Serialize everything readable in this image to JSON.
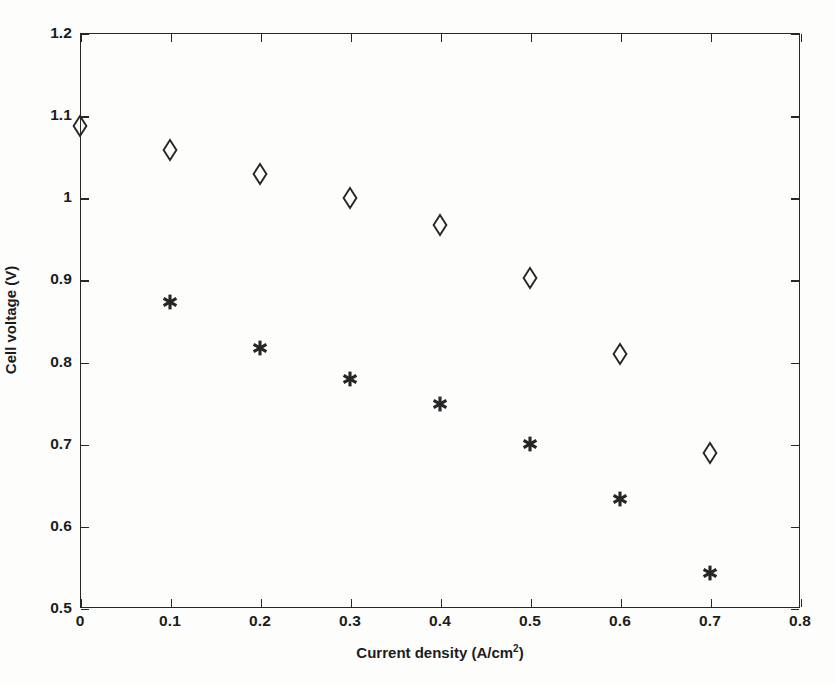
{
  "chart_data": {
    "type": "scatter",
    "title": "",
    "xlabel": "Current density (A/cm",
    "xlabel_sup": "2",
    "xlabel_tail": ")",
    "xlabel_full": "Current density (A/cm2)",
    "ylabel": "Cell voltage (V)",
    "xlim": [
      0,
      0.8
    ],
    "ylim": [
      0.5,
      1.2
    ],
    "xticks": [
      "0",
      "0.1",
      "0.2",
      "0.3",
      "0.4",
      "0.5",
      "0.6",
      "0.7",
      "0.8"
    ],
    "xtick_values": [
      0,
      0.1,
      0.2,
      0.3,
      0.4,
      0.5,
      0.6,
      0.7,
      0.8
    ],
    "yticks": [
      "0.5",
      "0.6",
      "0.7",
      "0.8",
      "0.9",
      "1",
      "1.1",
      "1.2"
    ],
    "ytick_values": [
      0.5,
      0.6,
      0.7,
      0.8,
      0.9,
      1.0,
      1.1,
      1.2
    ],
    "grid": false,
    "legend": "none",
    "frame": "box",
    "tick_direction": "in",
    "marker_color": "#262626",
    "series": [
      {
        "name": "diamond-series",
        "marker": "open-diamond",
        "x": [
          0,
          0.1,
          0.2,
          0.3,
          0.4,
          0.5,
          0.6,
          0.7
        ],
        "y": [
          1.087,
          1.058,
          1.028,
          0.999,
          0.966,
          0.902,
          0.809,
          0.689
        ]
      },
      {
        "name": "asterisk-series",
        "marker": "asterisk",
        "x": [
          0.1,
          0.2,
          0.3,
          0.4,
          0.5,
          0.6,
          0.7
        ],
        "y": [
          0.872,
          0.817,
          0.779,
          0.748,
          0.7,
          0.633,
          0.543
        ]
      }
    ]
  }
}
